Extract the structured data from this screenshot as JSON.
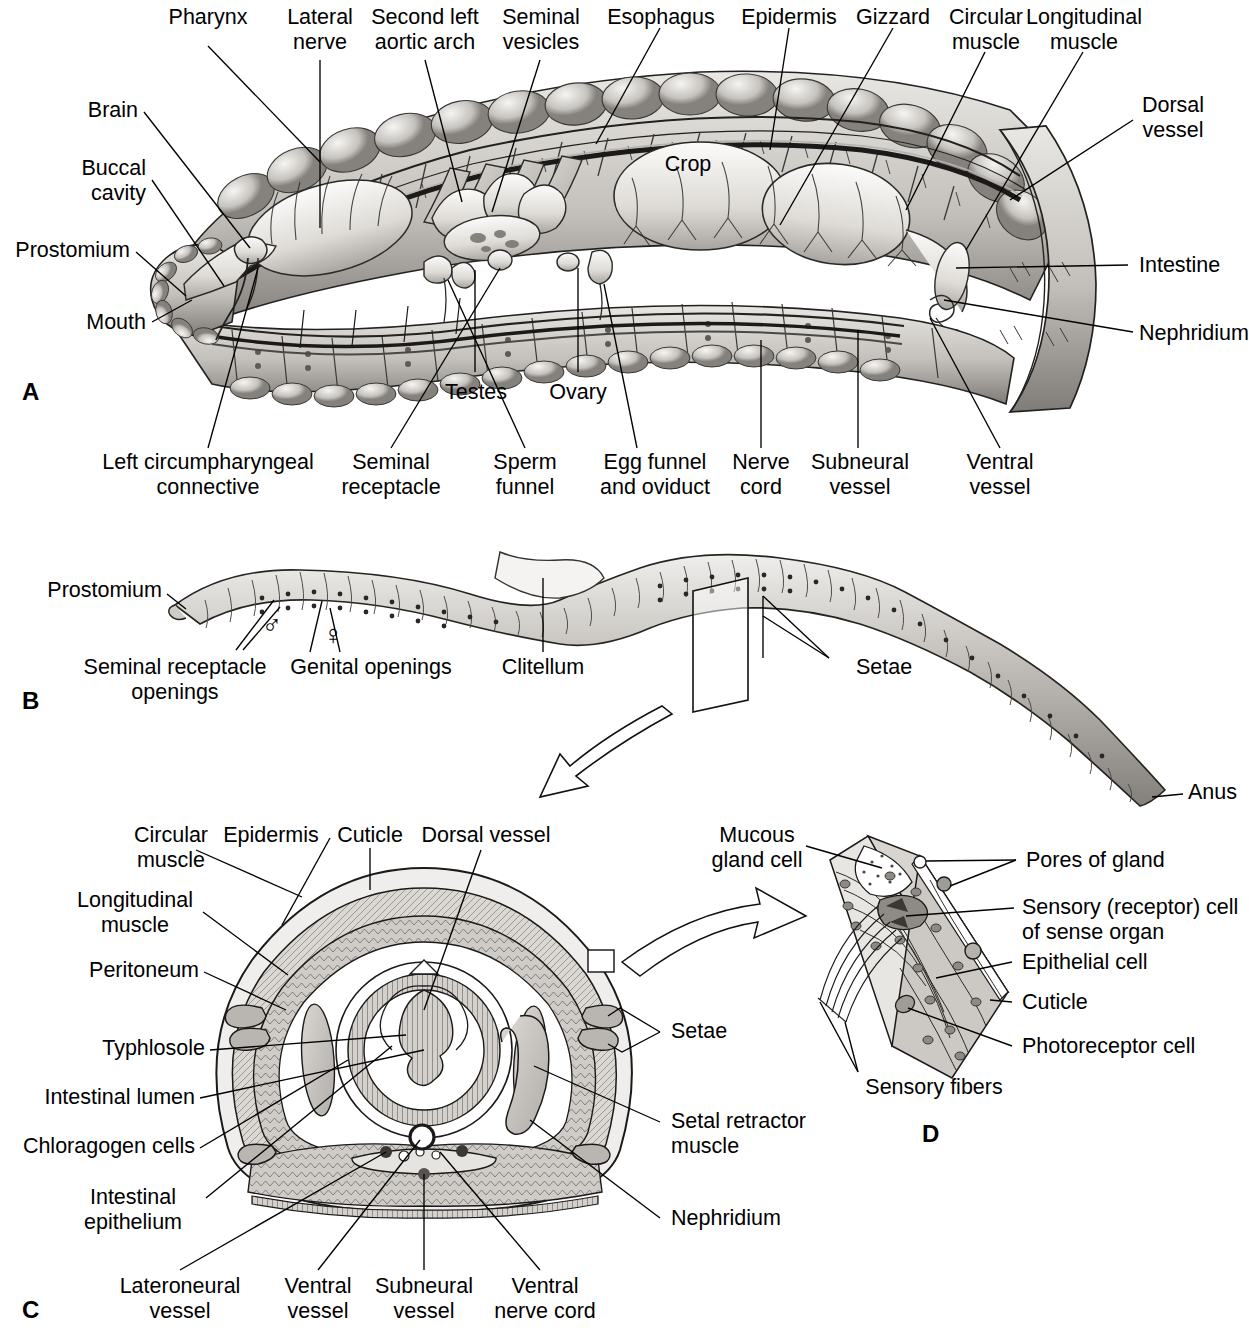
{
  "figure": {
    "panels": [
      {
        "letter": "A",
        "name": "internal-structure-lateral"
      },
      {
        "letter": "B",
        "name": "external-whole-worm"
      },
      {
        "letter": "C",
        "name": "cross-section"
      },
      {
        "letter": "D",
        "name": "epidermis-detail"
      }
    ]
  },
  "panelA": {
    "letter": "A",
    "labels": {
      "pharynx": "Pharynx",
      "lateral_nerve": "Lateral\nnerve",
      "second_left_aortic_arch": "Second left\naortic arch",
      "seminal_vesicles": "Seminal\nvesicles",
      "esophagus": "Esophagus",
      "epidermis": "Epidermis",
      "gizzard": "Gizzard",
      "circular_muscle": "Circular\nmuscle",
      "longitudinal_muscle": "Longitudinal\nmuscle",
      "brain": "Brain",
      "buccal_cavity": "Buccal\ncavity",
      "prostomium": "Prostomium",
      "mouth": "Mouth",
      "crop": "Crop",
      "dorsal_vessel": "Dorsal\nvessel",
      "intestine": "Intestine",
      "nephridium": "Nephridium",
      "testes": "Testes",
      "ovary": "Ovary",
      "left_circumpharyngeal_connective": "Left circumpharyngeal\nconnective",
      "seminal_receptacle": "Seminal\nreceptacle",
      "sperm_funnel": "Sperm\nfunnel",
      "egg_funnel_and_oviduct": "Egg funnel\nand oviduct",
      "nerve_cord": "Nerve\ncord",
      "subneural_vessel": "Subneural\nvessel",
      "ventral_vessel": "Ventral\nvessel"
    }
  },
  "panelB": {
    "letter": "B",
    "labels": {
      "prostomium": "Prostomium",
      "seminal_receptacle_openings": "Seminal receptacle\nopenings",
      "genital_openings": "Genital openings",
      "clitellum": "Clitellum",
      "setae": "Setae",
      "anus": "Anus",
      "male_symbol": "♂",
      "female_symbol": "♀"
    }
  },
  "panelC": {
    "letter": "C",
    "labels": {
      "circular_muscle": "Circular\nmuscle",
      "epidermis": "Epidermis",
      "cuticle": "Cuticle",
      "dorsal_vessel": "Dorsal vessel",
      "longitudinal_muscle": "Longitudinal\nmuscle",
      "peritoneum": "Peritoneum",
      "typhlosole": "Typhlosole",
      "intestinal_lumen": "Intestinal lumen",
      "chloragogen_cells": "Chloragogen cells",
      "intestinal_epithelium": "Intestinal\nepithelium",
      "setae": "Setae",
      "setal_retractor_muscle": "Setal retractor\nmuscle",
      "nephridium": "Nephridium",
      "lateroneural_vessel": "Lateroneural\nvessel",
      "ventral_vessel": "Ventral\nvessel",
      "subneural_vessel": "Subneural\nvessel",
      "ventral_nerve_cord": "Ventral\nnerve cord"
    }
  },
  "panelD": {
    "letter": "D",
    "labels": {
      "mucous_gland_cell": "Mucous\ngland cell",
      "pores_of_gland": "Pores of gland",
      "sensory_receptor_cell": "Sensory (receptor) cell\nof sense organ",
      "epithelial_cell": "Epithelial cell",
      "cuticle": "Cuticle",
      "photoreceptor_cell": "Photoreceptor cell",
      "sensory_fibers": "Sensory fibers"
    }
  },
  "colors": {
    "ink": "#000000",
    "background": "#ffffff",
    "tissue_light": "#e4e2de",
    "tissue_mid": "#bdbab5",
    "tissue_dark": "#8e8b86",
    "tissue_darker": "#5e5c58"
  }
}
